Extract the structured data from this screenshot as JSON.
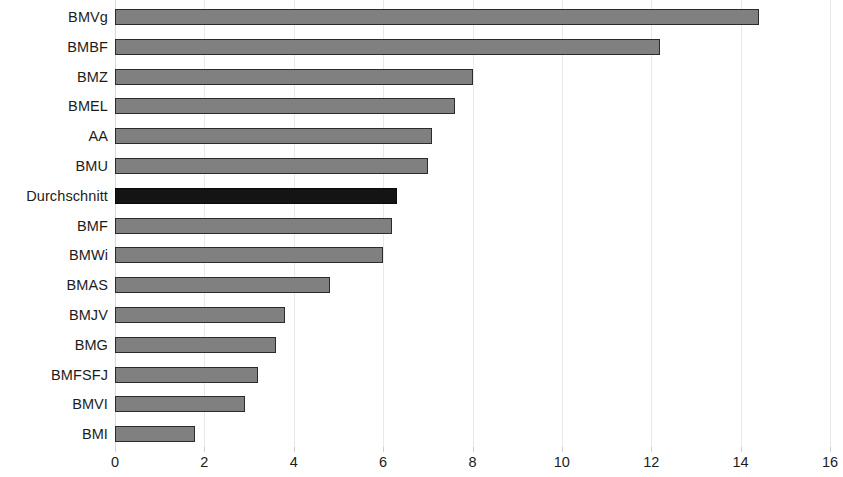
{
  "chart_data": {
    "type": "bar",
    "orientation": "horizontal",
    "title": "",
    "subtitle": "",
    "xlabel": "",
    "ylabel": "",
    "categories": [
      "BMVg",
      "BMBF",
      "BMZ",
      "BMEL",
      "AA",
      "BMU",
      "Durchschnitt",
      "BMF",
      "BMWi",
      "BMAS",
      "BMJV",
      "BMG",
      "BMFSFJ",
      "BMVI",
      "BMI"
    ],
    "values": [
      14.4,
      12.2,
      8.0,
      7.6,
      7.1,
      7.0,
      6.3,
      6.2,
      6.0,
      4.8,
      3.8,
      3.6,
      3.2,
      2.9,
      1.8
    ],
    "highlight_category": "Durchschnitt",
    "highlight_index": 6,
    "xlim": [
      0,
      16
    ],
    "xticks": [
      0,
      2,
      4,
      6,
      8,
      10,
      12,
      14,
      16
    ],
    "xtick_labels": [
      "0",
      "2",
      "4",
      "6",
      "8",
      "10",
      "12",
      "14",
      "16"
    ],
    "grid": true,
    "grid_axis": "x",
    "legend": false,
    "legend_position": "none",
    "colors": {
      "bar_fill": "#808080",
      "bar_border": "#2b2b2b",
      "highlight_fill": "#141414",
      "highlight_border": "#0b0b0b",
      "gridline": "#e9e9e9",
      "axis_line": "#d8d8d8",
      "text": "#1c1c1c",
      "background": "#ffffff"
    }
  }
}
